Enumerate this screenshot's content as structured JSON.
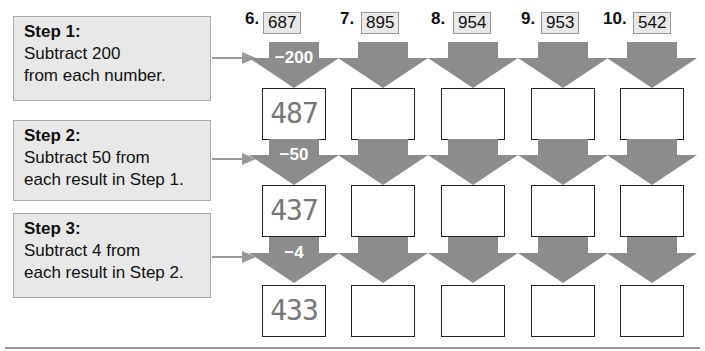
{
  "steps": [
    {
      "title": "Step 1:",
      "line1": "Subtract 200",
      "line2": "from each number."
    },
    {
      "title": "Step 2:",
      "line1": "Subtract 50 from",
      "line2": "each result in Step 1."
    },
    {
      "title": "Step 3:",
      "line1": "Subtract 4 from",
      "line2": "each result in Step 2."
    }
  ],
  "operations": [
    "−200",
    "−50",
    "−4"
  ],
  "problems": [
    {
      "number": "6.",
      "value": "687",
      "answers": [
        "487",
        "437",
        "433"
      ]
    },
    {
      "number": "7.",
      "value": "895",
      "answers": [
        "",
        "",
        ""
      ]
    },
    {
      "number": "8.",
      "value": "954",
      "answers": [
        "",
        "",
        ""
      ]
    },
    {
      "number": "9.",
      "value": "953",
      "answers": [
        "",
        "",
        ""
      ]
    },
    {
      "number": "10.",
      "value": "542",
      "answers": [
        "",
        "",
        ""
      ]
    }
  ],
  "colors": {
    "arrow": "#8c8c8c",
    "step_bg": "#e8e8e8",
    "border": "#222222"
  }
}
